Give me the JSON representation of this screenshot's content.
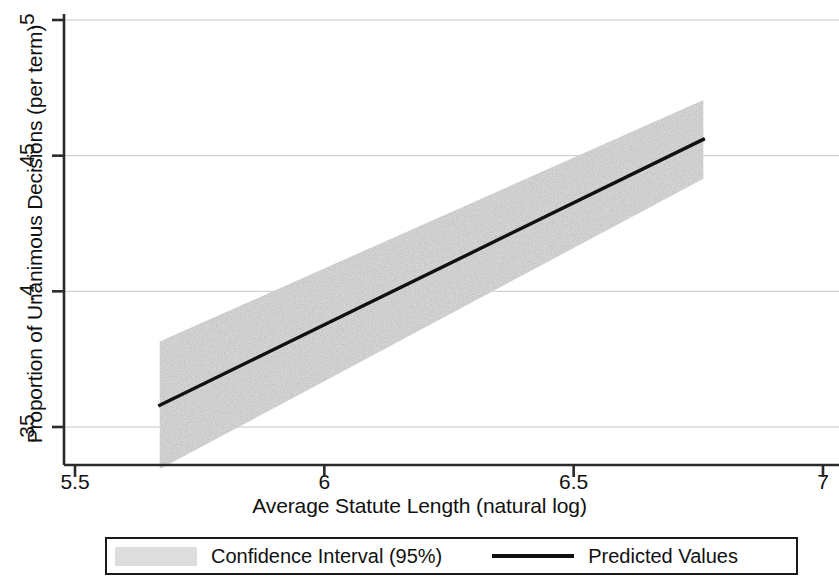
{
  "chart_data": {
    "type": "line",
    "title": "",
    "xlabel": "Average Statute Length (natural log)",
    "ylabel": "Proportion of Unanimous Decisions (per term)",
    "xlim": [
      5.5,
      7.0
    ],
    "ylim": [
      0.335,
      0.503
    ],
    "xticks": [
      5.5,
      6,
      6.5,
      7
    ],
    "xticklabels": [
      "5.5",
      "6",
      "6.5",
      "7"
    ],
    "yticks": [
      0.35,
      0.4,
      0.45,
      0.5
    ],
    "yticklabels": [
      ".35",
      ".4",
      ".45",
      ".5"
    ],
    "grid": "horizontal-faint",
    "legend_position": "below-axes",
    "series": [
      {
        "name": "Predicted Values",
        "type": "line",
        "color": "#111111",
        "x": [
          5.67,
          6.76
        ],
        "y": [
          0.358,
          0.456
        ]
      },
      {
        "name": "Confidence Interval (95%)",
        "type": "band",
        "color": "#dddddd",
        "x": [
          5.67,
          6.76
        ],
        "lower": [
          0.3345,
          0.4415
        ],
        "upper": [
          0.3815,
          0.4705
        ]
      }
    ],
    "legend_entries": [
      {
        "label": "Confidence Interval (95%)",
        "marker": "filled-rect",
        "color": "#dddddd"
      },
      {
        "label": "Predicted Values",
        "marker": "line",
        "color": "#111111"
      }
    ]
  },
  "axis": {
    "y_title": "Proportion of Unanimous Decisions (per term)",
    "x_title": "Average Statute Length (natural log)",
    "y_labels": [
      ".5",
      ".45",
      ".4",
      ".35"
    ],
    "x_labels": [
      "5.5",
      "6",
      "6.5",
      "7"
    ]
  },
  "legend": {
    "ci_label": "Confidence Interval (95%)",
    "pred_label": "Predicted Values"
  }
}
